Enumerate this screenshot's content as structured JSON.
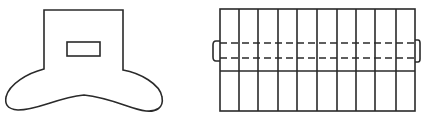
{
  "canvas": {
    "width": 421,
    "height": 118,
    "background": "#ffffff"
  },
  "style": {
    "line_color": "#2a2a2a",
    "line_width": 1.6
  },
  "figures": [
    {
      "id": "flared-body",
      "body_rect": {
        "x1": 44,
        "x2": 123,
        "top": 10,
        "left_bottom": 69,
        "right_bottom": 70
      },
      "window_rect": {
        "x": 67,
        "y": 42,
        "w": 33,
        "h": 14
      },
      "base_outline": {
        "left_extent": 5,
        "right_extent": 162,
        "bottom": 111,
        "center_arch_top": 95
      }
    },
    {
      "id": "segmented-grid",
      "frame": {
        "x": 220,
        "y": 9,
        "w": 195,
        "h": 102
      },
      "vertical_lines_x": [
        239,
        258,
        278,
        297,
        317,
        337,
        356,
        375,
        396
      ],
      "solid_divider_y": 71,
      "dashed_lines_y": [
        43,
        58
      ],
      "dash_pattern": "7 4",
      "left_tab": {
        "x": 213,
        "y1": 41,
        "y2": 61
      },
      "right_tab": {
        "x": 420,
        "y1": 40,
        "y2": 62
      }
    }
  ]
}
